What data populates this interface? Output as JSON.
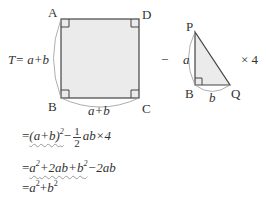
{
  "figure": {
    "square": {
      "vertices": {
        "A": "A",
        "B": "B",
        "C": "C",
        "D": "D"
      },
      "side_left_label": "T= a+b",
      "side_bottom_label": "a+b",
      "fill": "#ebebeb"
    },
    "operator_minus": "−",
    "triangle": {
      "vertices": {
        "P": "P",
        "B": "B",
        "Q": "Q"
      },
      "side_PB_label": "a",
      "side_BQ_label": "b",
      "fill": "#ebebeb"
    },
    "multiplier": "× 4"
  },
  "derivation": {
    "line1": {
      "eq": "=",
      "term1": "(a+b)",
      "term1_exp": "2",
      "minus": "−",
      "frac_num": "1",
      "frac_den": "2",
      "rest": "ab×4"
    },
    "line2": {
      "eq": "=",
      "wavy_part_a": "a",
      "exp1": "2",
      "wavy_part_mid": "+2ab+b",
      "exp2": "2",
      "rest": "−2ab"
    },
    "line3": {
      "eq": "=",
      "a": "a",
      "exp1": "2",
      "plus": "+",
      "b": "b",
      "exp2": "2"
    }
  }
}
